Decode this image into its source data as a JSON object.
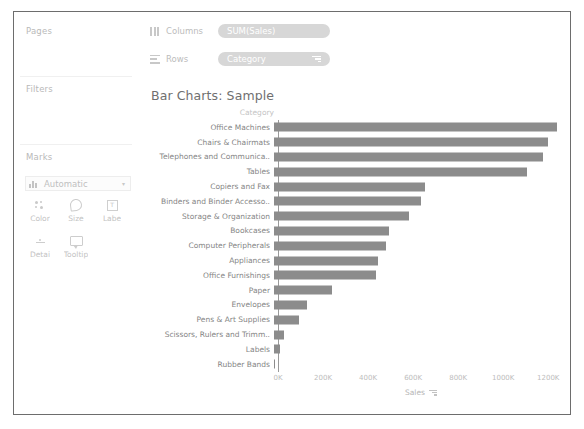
{
  "left_panel": {
    "pages_label": "Pages",
    "filters_label": "Filters",
    "marks_label": "Marks",
    "marks_type": "Automatic",
    "marks_caret": "▾",
    "mark_buttons": [
      {
        "label": "Color",
        "icon": "color-dots-icon"
      },
      {
        "label": "Size",
        "icon": "size-circle-icon"
      },
      {
        "label": "Labe",
        "icon": "label-text-icon"
      },
      {
        "label": "Detai",
        "icon": "detail-icon"
      },
      {
        "label": "Tooltip",
        "icon": "tooltip-bubble-icon"
      }
    ],
    "label_glyph": "T"
  },
  "shelves": {
    "columns_label": "Columns",
    "rows_label": "Rows",
    "columns_pill": "SUM(Sales)",
    "rows_pill": "Category",
    "rows_pill_has_sort": true
  },
  "viz": {
    "title": "Bar Charts: Sample",
    "row_header": "Category",
    "axis_title": "Sales",
    "axis_has_sort": true
  },
  "chart_data": {
    "type": "bar",
    "orientation": "horizontal",
    "title": "Bar Charts: Sample",
    "xlabel": "Sales",
    "ylabel": "Category",
    "xlim": [
      0,
      1270
    ],
    "xunit": "K",
    "grid": false,
    "legend": "none",
    "bar_color": "#8c8c8c",
    "tick_labels": [
      "0K",
      "200K",
      "400K",
      "600K",
      "800K",
      "1000K",
      "1200K"
    ],
    "tick_values": [
      0,
      200,
      400,
      600,
      800,
      1000,
      1200
    ],
    "categories": [
      "Office Machines",
      "Chairs & Chairmats",
      "Telephones and Communica..",
      "Tables",
      "Copiers and Fax",
      "Binders and Binder Accesso..",
      "Storage & Organization",
      "Bookcases",
      "Computer Peripherals",
      "Appliances",
      "Office Furnishings",
      "Paper",
      "Envelopes",
      "Pens & Art Supplies",
      "Scissors, Rulers and Trimm..",
      "Labels",
      "Rubber Bands"
    ],
    "values": [
      1240,
      1200,
      1180,
      1110,
      660,
      645,
      590,
      505,
      490,
      455,
      445,
      255,
      145,
      110,
      42,
      25,
      5
    ]
  }
}
